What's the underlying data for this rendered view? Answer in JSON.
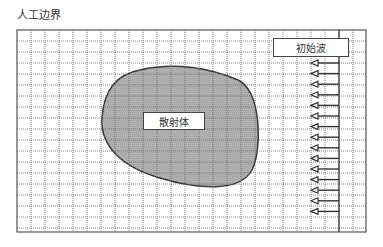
{
  "title": "人工边界",
  "scatterer": {
    "label": "散射体",
    "fill_color": "#a8a8a8",
    "outline_color": "#333333"
  },
  "incident_wave": {
    "label": "初始波",
    "arrow_count": 15,
    "direction": "left"
  },
  "grid": {
    "line_color": "#555555",
    "style": "dotted"
  }
}
